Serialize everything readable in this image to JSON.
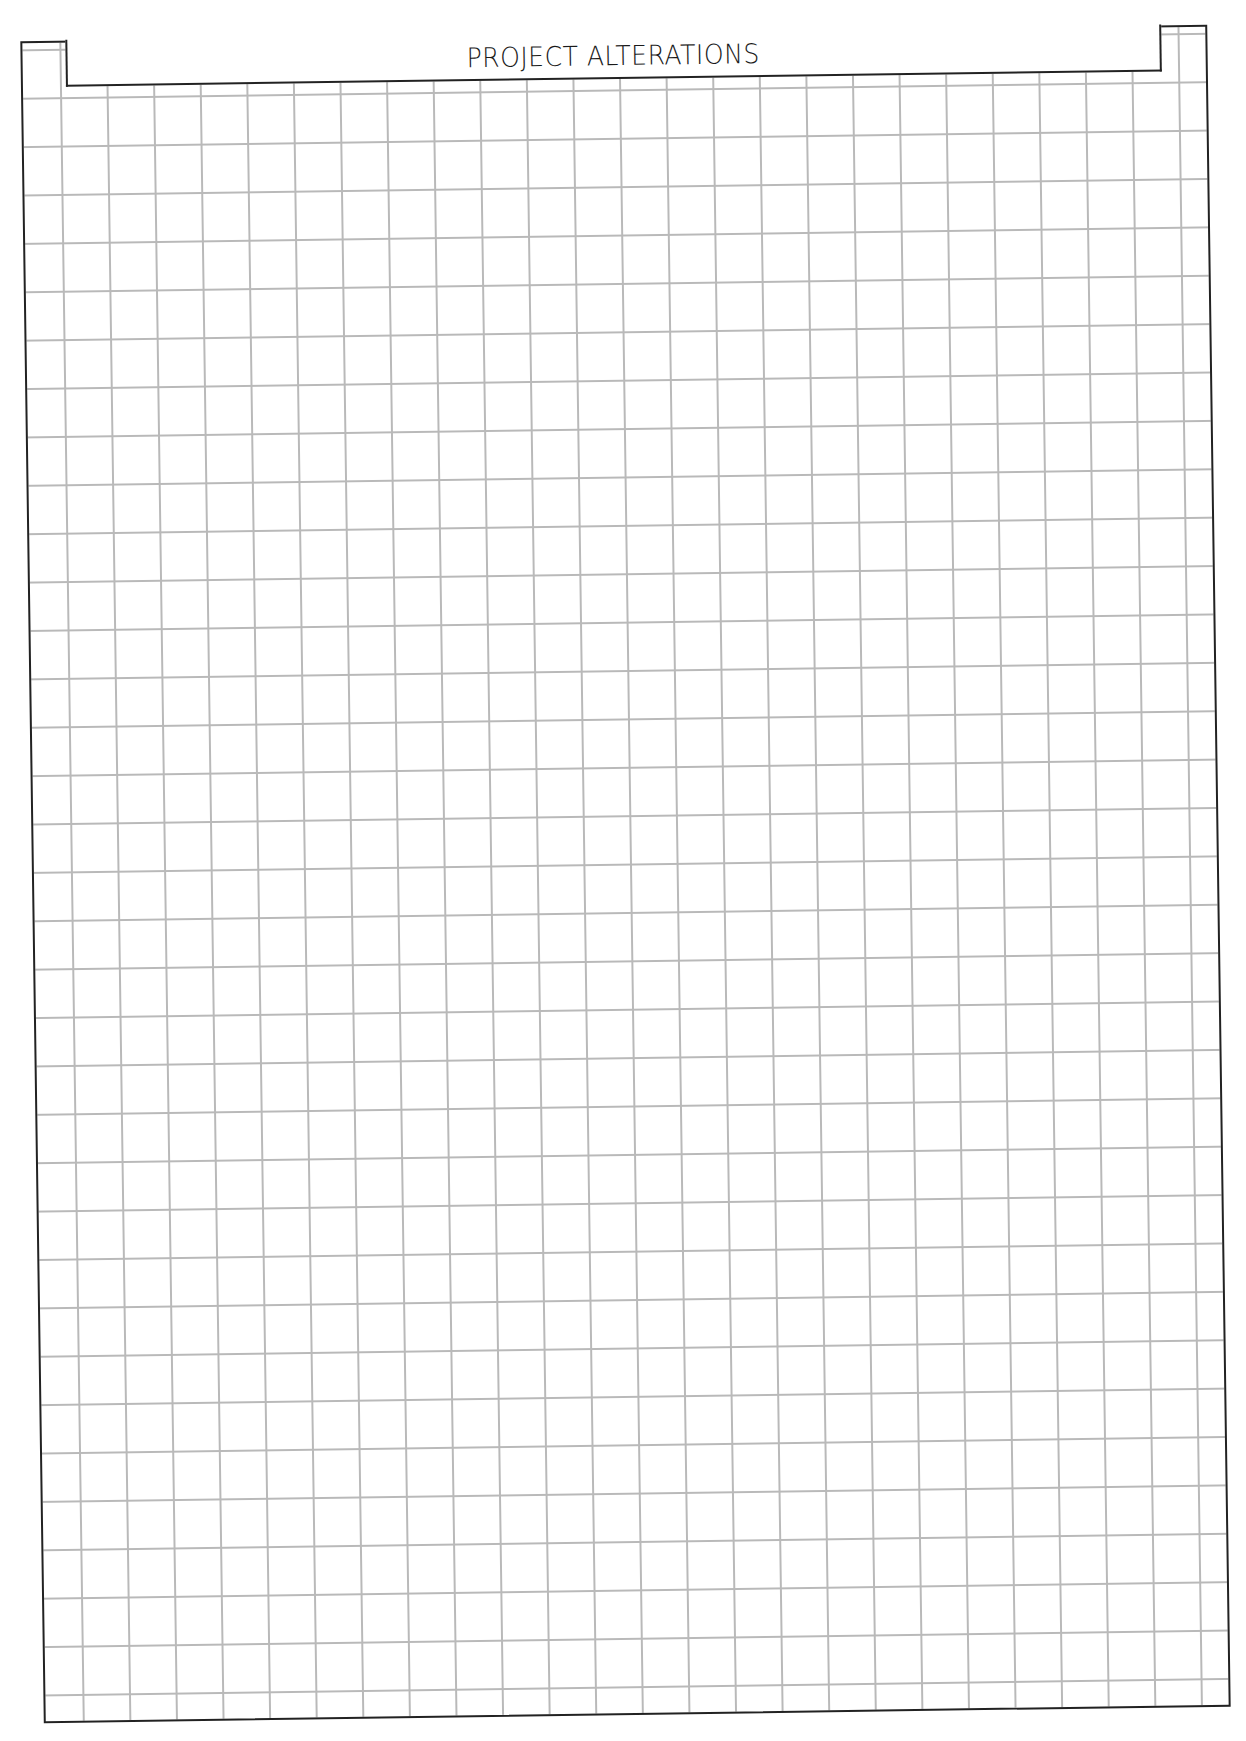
{
  "document": {
    "title": "PROJECT ALTERATIONS",
    "type": "grid-worksheet",
    "grid": {
      "columns": 25,
      "rows": 35,
      "line_color": "#b9b9b9",
      "border_color": "#222222"
    }
  }
}
